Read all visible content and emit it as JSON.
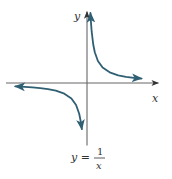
{
  "chart_data": {
    "type": "line",
    "title": "",
    "function": "y = 1/x",
    "xlabel": "x",
    "ylabel": "y",
    "caption": {
      "lhs": "y =",
      "numerator": "1",
      "denominator": "x"
    },
    "xlim": [
      -5,
      4
    ],
    "ylim": [
      -4,
      4.5
    ],
    "grid": false,
    "ticks": false,
    "series": [
      {
        "name": "branch-positive",
        "x": [
          0.22,
          0.25,
          0.3,
          0.4,
          0.5,
          0.7,
          1,
          1.5,
          2,
          2.5,
          3,
          3.5
        ],
        "y": [
          4.55,
          4,
          3.33,
          2.5,
          2,
          1.43,
          1,
          0.67,
          0.5,
          0.4,
          0.33,
          0.29
        ],
        "arrows": "both"
      },
      {
        "name": "branch-negative",
        "x": [
          -4.6,
          -4,
          -3.5,
          -3,
          -2.5,
          -2,
          -1.5,
          -1,
          -0.7,
          -0.5,
          -0.4,
          -0.33
        ],
        "y": [
          -0.22,
          -0.25,
          -0.29,
          -0.33,
          -0.4,
          -0.5,
          -0.67,
          -1,
          -1.43,
          -2,
          -2.5,
          -3.0
        ],
        "arrows": "both"
      }
    ],
    "colors": {
      "curve": "#2f5f73",
      "axis": "#555555",
      "text": "#333333"
    }
  }
}
